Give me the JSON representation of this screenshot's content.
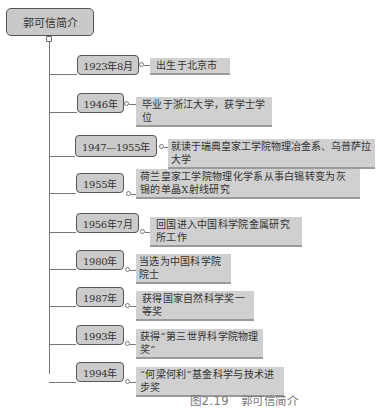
{
  "root": {
    "title": "郭可信简介"
  },
  "timeline": [
    {
      "year": "1923年8月",
      "event": "出生于北京市"
    },
    {
      "year": "1946年",
      "event": "毕业于浙江大学，获学士学位"
    },
    {
      "year": "1947—1955年",
      "event": "就读于瑞典皇家工学院物理冶金系、乌普萨拉大学"
    },
    {
      "year": "1955年",
      "event": "荷兰皇家工学院物理化学系从事白锡转变为灰锡的单晶X射线研究"
    },
    {
      "year": "1956年7月",
      "event": "回国进入中国科学院金属研究所工作"
    },
    {
      "year": "1980年",
      "event": "当选为中国科学院院士"
    },
    {
      "year": "1987年",
      "event": "获得国家自然科学奖一等奖"
    },
    {
      "year": "1993年",
      "event": "获得“第三世界科学院物理奖”"
    },
    {
      "year": "1994年",
      "event": "“何梁何利”基金科学与技术进步奖"
    }
  ],
  "caption": "图2.19　郭可信简介",
  "colors": {
    "box_fill": "#cbcbcb",
    "box_border": "#555555",
    "label_fill": "#d0d0d0",
    "line": "#777777"
  }
}
